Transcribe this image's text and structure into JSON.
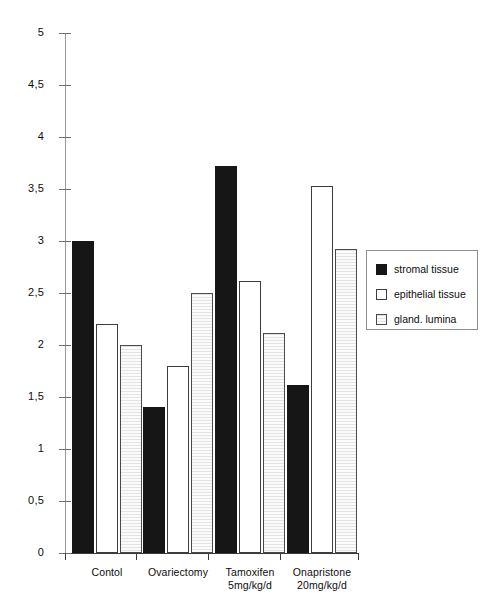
{
  "chart_data": {
    "type": "bar",
    "title": "",
    "subtitle": "",
    "xlabel": "",
    "ylabel": "",
    "ylim": [
      0,
      5
    ],
    "grid": false,
    "legend_position": "right",
    "decimal_separator": ",",
    "categories": [
      "Contol",
      "Ovariectomy",
      "Tamoxifen\n5mg/kg/d",
      "Onapristone\n20mg/kg/d"
    ],
    "category_lines": [
      [
        "Contol"
      ],
      [
        "Ovariectomy"
      ],
      [
        "Tamoxifen",
        "5mg/kg/d"
      ],
      [
        "Onapristone",
        "20mg/kg/d"
      ]
    ],
    "ytick_values": [
      0,
      0.5,
      1,
      1.5,
      2,
      2.5,
      3,
      3.5,
      4,
      4.5,
      5
    ],
    "ytick_labels": [
      "0",
      "0,5",
      "1",
      "1,5",
      "2",
      "2,5",
      "3",
      "3,5",
      "4",
      "4,5",
      "5"
    ],
    "series": [
      {
        "name": "stromal tissue",
        "key": "stromal",
        "color": "#161616",
        "values": [
          3.0,
          1.4,
          3.72,
          1.62
        ]
      },
      {
        "name": "epithelial tissue",
        "key": "epithelial",
        "color": "#ffffff",
        "values": [
          2.2,
          1.8,
          2.62,
          3.53
        ]
      },
      {
        "name": "gland. lumina",
        "key": "lumina",
        "color": "#ededed",
        "values": [
          2.0,
          2.5,
          2.12,
          2.92
        ]
      }
    ]
  },
  "legend": {
    "items": [
      {
        "label": "stromal tissue",
        "key": "stromal"
      },
      {
        "label": "epithelial tissue",
        "key": "epithelial"
      },
      {
        "label": "gland. lumina",
        "key": "lumina"
      }
    ]
  }
}
